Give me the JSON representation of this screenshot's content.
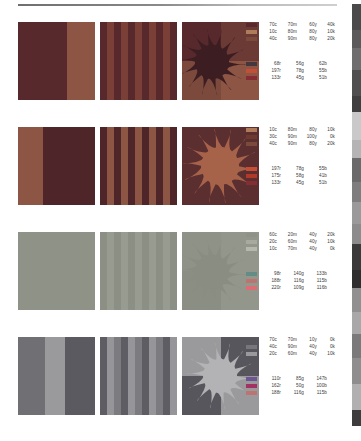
{
  "document": {
    "title": "Color Reproduction Test Chart",
    "panel_count": 12,
    "row_count": 4
  },
  "rule": {
    "name": "header-rule"
  },
  "rows": [
    {
      "id": "row-1",
      "panels": [
        {
          "type": "bands",
          "name": "panel-split-bands",
          "bands": [
            {
              "color": "#57292c",
              "width": 64
            },
            {
              "color": "#8d5544",
              "width": 36
            }
          ]
        },
        {
          "type": "stripes",
          "name": "panel-vertical-stripes",
          "colors": [
            "#57292c",
            "#7a4038"
          ],
          "stripe_count": 11
        },
        {
          "type": "sun",
          "name": "panel-sun-starburst",
          "quadrants": [
            "#57292c",
            "#6b3a35",
            "#7b4a3c",
            "#8d5544"
          ],
          "sun_color": "#3c1d22",
          "sun_style": "rays-offset",
          "disc_r": 17,
          "cx": 30,
          "cy": 40
        }
      ],
      "cmyk_legend": {
        "name": "cmyk-legend",
        "entries": [
          {
            "swatch": "#57292c",
            "c": "70c",
            "m": "70m",
            "y": "60y",
            "k": "40k"
          },
          {
            "swatch": "#b07b5a",
            "c": "10c",
            "m": "80m",
            "y": "80y",
            "k": "10k"
          },
          {
            "swatch": "#7b4a3c",
            "c": "40c",
            "m": "90m",
            "y": "80y",
            "k": "20k"
          }
        ]
      },
      "rgb_legend": {
        "name": "rgb-legend",
        "entries": [
          {
            "swatch": "#44383e",
            "r": "68r",
            "g": "56g",
            "b": "62b"
          },
          {
            "swatch": "#c54e37",
            "r": "197r",
            "g": "78g",
            "b": "55b"
          },
          {
            "swatch": "#852d33",
            "r": "133r",
            "g": "45g",
            "b": "51b"
          }
        ]
      }
    },
    {
      "id": "row-2",
      "panels": [
        {
          "type": "bands",
          "name": "panel-split-bands",
          "bands": [
            {
              "color": "#8d5544",
              "width": 33
            },
            {
              "color": "#4e2529",
              "width": 67
            }
          ]
        },
        {
          "type": "stripes",
          "name": "panel-vertical-stripes",
          "colors": [
            "#4e2529",
            "#8d5544"
          ],
          "stripe_count": 11
        },
        {
          "type": "sun",
          "name": "panel-sun-centered",
          "quadrants": [
            "#5b2f30",
            "#5b2f30",
            "#5b2f30",
            "#5b2f30"
          ],
          "sun_color": "#a7624a",
          "sun_style": "rays-centered",
          "disc_r": 19,
          "cx": 38,
          "cy": 39
        }
      ],
      "cmyk_legend": {
        "name": "cmyk-legend",
        "entries": [
          {
            "swatch": "#b07b5a",
            "c": "10c",
            "m": "80m",
            "y": "80y",
            "k": "10k"
          },
          {
            "swatch": "#6e3a2f",
            "c": "30c",
            "m": "90m",
            "y": "100y",
            "k": "0k"
          },
          {
            "swatch": "#7b4a3c",
            "c": "40c",
            "m": "90m",
            "y": "80y",
            "k": "20k"
          }
        ]
      },
      "rgb_legend": {
        "name": "rgb-legend",
        "entries": [
          {
            "swatch": "#c54e37",
            "r": "197r",
            "g": "78g",
            "b": "55b"
          },
          {
            "swatch": "#af3a29",
            "r": "175r",
            "g": "58g",
            "b": "41b"
          },
          {
            "swatch": "#852d33",
            "r": "133r",
            "g": "45g",
            "b": "51b"
          }
        ]
      }
    },
    {
      "id": "row-3",
      "panels": [
        {
          "type": "bands",
          "name": "panel-split-bands",
          "bands": [
            {
              "color": "#8f9287",
              "width": 100
            }
          ]
        },
        {
          "type": "stripes",
          "name": "panel-vertical-stripes",
          "colors": [
            "#8c8f84",
            "#989b90"
          ],
          "stripe_count": 11
        },
        {
          "type": "sun",
          "name": "panel-sun-lowcontrast",
          "quadrants": [
            "#8f9287",
            "#93968b",
            "#8b8e83",
            "#93968b"
          ],
          "sun_color": "#8a8d82",
          "sun_style": "rays-offset",
          "disc_r": 17,
          "cx": 30,
          "cy": 40
        }
      ],
      "cmyk_legend": {
        "name": "cmyk-legend",
        "entries": [
          {
            "swatch": "#8f9287",
            "c": "60c",
            "m": "20m",
            "y": "40y",
            "k": "20k"
          },
          {
            "swatch": "#a8aa9f",
            "c": "20c",
            "m": "60m",
            "y": "40y",
            "k": "10k"
          },
          {
            "swatch": "#b6b8ad",
            "c": "10c",
            "m": "70m",
            "y": "40y",
            "k": "0k"
          }
        ]
      },
      "rgb_legend": {
        "name": "rgb-legend",
        "entries": [
          {
            "swatch": "#628c85",
            "r": "98r",
            "g": "140g",
            "b": "133b"
          },
          {
            "swatch": "#bc7473",
            "r": "188r",
            "g": "116g",
            "b": "115b"
          },
          {
            "swatch": "#dc6d74",
            "r": "220r",
            "g": "109g",
            "b": "116b"
          }
        ]
      }
    },
    {
      "id": "row-4",
      "panels": [
        {
          "type": "bands",
          "name": "panel-split-bands",
          "bands": [
            {
              "color": "#6f6f74",
              "width": 35
            },
            {
              "color": "#9a9a9d",
              "width": 26
            },
            {
              "color": "#5a5a60",
              "width": 39
            }
          ]
        },
        {
          "type": "stripes",
          "name": "panel-vertical-stripes",
          "colors": [
            "#5d5d63",
            "#96969a",
            "#7b7b80"
          ],
          "stripe_count": 11
        },
        {
          "type": "sun",
          "name": "panel-sun-quadrant",
          "quadrants": [
            "#9a9a9d",
            "#56565c",
            "#56565c",
            "#9a9a9d"
          ],
          "sun_color": "#b3b3b6",
          "sun_style": "rays-centered",
          "disc_r": 17,
          "cx": 38,
          "cy": 39
        }
      ],
      "cmyk_legend": {
        "name": "cmyk-legend",
        "entries": [
          {
            "swatch": "#56565c",
            "c": "70c",
            "m": "70m",
            "y": "10y",
            "k": "0k"
          },
          {
            "swatch": "#76767c",
            "c": "40c",
            "m": "90m",
            "y": "40y",
            "k": "0k"
          },
          {
            "swatch": "#9a9a9d",
            "c": "20c",
            "m": "60m",
            "y": "40y",
            "k": "10k"
          }
        ]
      },
      "rgb_legend": {
        "name": "rgb-legend",
        "entries": [
          {
            "swatch": "#6e5593",
            "r": "110r",
            "g": "85g",
            "b": "147b"
          },
          {
            "swatch": "#a23264",
            "r": "162r",
            "g": "50g",
            "b": "100b"
          },
          {
            "swatch": "#bc7473",
            "r": "188r",
            "g": "116g",
            "b": "115b"
          }
        ]
      }
    }
  ],
  "edge_strip": {
    "name": "edge-color-strip",
    "segments": [
      {
        "color": "#ffffff",
        "h": 4
      },
      {
        "color": "#4a4a4a",
        "h": 26
      },
      {
        "color": "#5a5a5a",
        "h": 18
      },
      {
        "color": "#6e6e6e",
        "h": 22
      },
      {
        "color": "#4f4f4f",
        "h": 26
      },
      {
        "color": "#3f3f3f",
        "h": 16
      },
      {
        "color": "#c9c9c9",
        "h": 28
      },
      {
        "color": "#b4b4b4",
        "h": 18
      },
      {
        "color": "#6a6a6a",
        "h": 24
      },
      {
        "color": "#7e7e7e",
        "h": 20
      },
      {
        "color": "#9a9a9a",
        "h": 22
      },
      {
        "color": "#8c8c8c",
        "h": 20
      },
      {
        "color": "#3a3a3a",
        "h": 26
      },
      {
        "color": "#2e2e2e",
        "h": 18
      },
      {
        "color": "#909090",
        "h": 24
      },
      {
        "color": "#a8a8a8",
        "h": 22
      },
      {
        "color": "#7a7a7a",
        "h": 24
      },
      {
        "color": "#8e8e8e",
        "h": 26
      },
      {
        "color": "#b0b0b0",
        "h": 26
      },
      {
        "color": "#3d3d3d",
        "h": 16
      },
      {
        "color": "#ffffff",
        "h": 15
      }
    ]
  }
}
